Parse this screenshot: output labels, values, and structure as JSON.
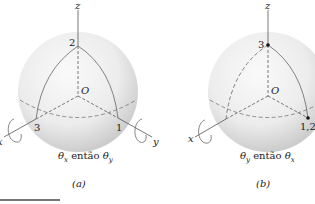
{
  "panels": [
    {
      "id": "a",
      "label": "(a)",
      "caption_theta1": "θ",
      "caption_sub1": "x",
      "caption_mid": " então ",
      "caption_theta2": "θ",
      "caption_sub2": "y",
      "axes": {
        "z": "z",
        "x": "x",
        "y": "y"
      },
      "origin": "O",
      "points": [
        "1",
        "2",
        "3"
      ]
    },
    {
      "id": "b",
      "label": "(b)",
      "caption_theta1": "θ",
      "caption_sub1": "y",
      "caption_mid": " então ",
      "caption_theta2": "θ",
      "caption_sub2": "x",
      "axes": {
        "z": "z",
        "x": "x",
        "y": "y"
      },
      "origin": "O",
      "points": [
        "3",
        "1,2"
      ]
    }
  ],
  "colors": {
    "sphere_light": "#f4f4f4",
    "sphere_dark": "#c9c9c9",
    "line": "#555555",
    "text": "#222222"
  }
}
